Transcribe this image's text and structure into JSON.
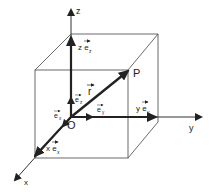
{
  "diagram": {
    "colors": {
      "line": "#333333",
      "vector": "#222222",
      "background": "#ffffff"
    },
    "labels": {
      "axis_x": "x",
      "axis_y": "y",
      "axis_z": "z",
      "origin": "O",
      "point": "P",
      "position_vector": "r",
      "z_component": "z e",
      "z_component_sub": "z",
      "y_component": "y e",
      "y_component_sub": "y",
      "x_component": "x e",
      "x_component_sub": "x",
      "unit_z": "e",
      "unit_z_sub": "z",
      "unit_y": "e",
      "unit_y_sub": "y",
      "unit_x": "e",
      "unit_x_sub": "x"
    }
  }
}
